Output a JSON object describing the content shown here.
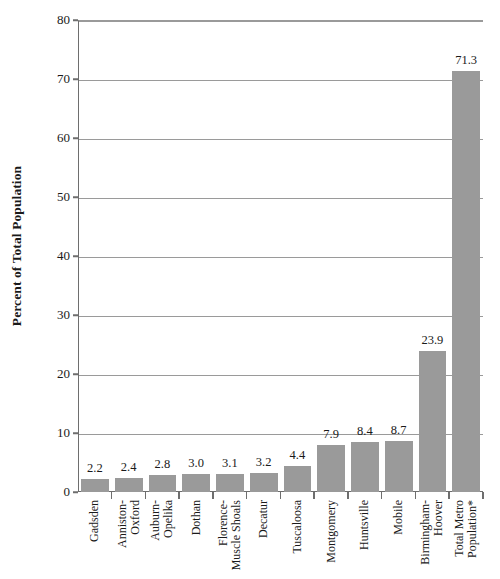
{
  "chart_data": {
    "type": "bar",
    "title": "",
    "subtitle": "",
    "xlabel": "",
    "ylabel": "Percent of Total Population",
    "ylim": [
      0,
      80
    ],
    "ytick_step": 10,
    "yticks": [
      "0",
      "10",
      "20",
      "30",
      "40",
      "50",
      "60",
      "70",
      "80"
    ],
    "grid": true,
    "legend": false,
    "bar_color": "#9a9a9a",
    "gridline_color": "#9a9a9a",
    "axis_color": "#6e6e6e",
    "categories": [
      "Gadsden",
      "Anniston-Oxford",
      "Auburn-Opelika",
      "Dothan",
      "Florence-Muscle Shoals",
      "Decatur",
      "Tuscaloosa",
      "Montgomery",
      "Huntsville",
      "Mobile",
      "Birmingham-Hoover",
      "Total Metro Population*"
    ],
    "category_lines": [
      [
        "Gadsden"
      ],
      [
        "Anniston-",
        "Oxford"
      ],
      [
        "Auburn-",
        "Opelika"
      ],
      [
        "Dothan"
      ],
      [
        "Florence-",
        "Muscle Shoals"
      ],
      [
        "Decatur"
      ],
      [
        "Tuscaloosa"
      ],
      [
        "Montgomery"
      ],
      [
        "Huntsville"
      ],
      [
        "Mobile"
      ],
      [
        "Birmingham-",
        "Hoover"
      ],
      [
        "Total Metro",
        "Population*"
      ]
    ],
    "values": [
      2.2,
      2.4,
      2.8,
      3.0,
      3.1,
      3.2,
      4.4,
      7.9,
      8.4,
      8.7,
      23.9,
      71.3
    ],
    "value_labels": [
      "2.2",
      "2.4",
      "2.8",
      "3.0",
      "3.1",
      "3.2",
      "4.4",
      "7.9",
      "8.4",
      "8.7",
      "23.9",
      "71.3"
    ]
  }
}
